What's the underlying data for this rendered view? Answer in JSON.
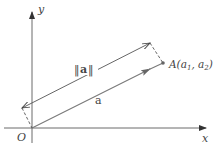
{
  "diagram": {
    "title": "",
    "axes": {
      "x_label": "x",
      "y_label": "y",
      "origin_label": "O"
    },
    "vector": {
      "name": "a",
      "tip_label": "A(a",
      "tip_sub1": "1",
      "tip_sep": ", a",
      "tip_sub2": "2",
      "tip_close": ")"
    },
    "magnitude": {
      "label_bars": "‖",
      "label_symbol": "a"
    },
    "colors": {
      "axis": "#6a6a6a",
      "vector": "#7a7a7a",
      "dimension": "#555555",
      "text": "#444444"
    }
  }
}
